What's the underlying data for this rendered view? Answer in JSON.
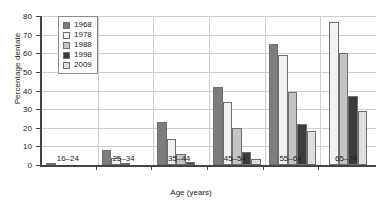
{
  "chart_data": {
    "type": "bar",
    "title": "",
    "xlabel": "Age (years)",
    "ylabel": "Percentage dentate",
    "categories": [
      "16–24",
      "25–34",
      "35–44",
      "45–54",
      "55–64",
      "65–74"
    ],
    "ylim": [
      0,
      80
    ],
    "yticks": [
      0,
      10,
      20,
      30,
      40,
      50,
      60,
      70,
      80
    ],
    "grid": true,
    "legend_position": "top-left-inside",
    "series": [
      {
        "name": "1968",
        "color": "#7d7d7d",
        "values": [
          1.0,
          8.0,
          23.0,
          42.0,
          65.0,
          null
        ]
      },
      {
        "name": "1978",
        "color": "#f2f2f2",
        "values": [
          0.0,
          4.0,
          14.0,
          34.0,
          59.0,
          77.0
        ]
      },
      {
        "name": "1988",
        "color": "#c4c4c4",
        "values": [
          0.0,
          1.0,
          6.0,
          20.0,
          39.0,
          60.0
        ]
      },
      {
        "name": "1998",
        "color": "#3b3b3b",
        "values": [
          0.0,
          0.0,
          1.5,
          7.0,
          22.0,
          37.0
        ]
      },
      {
        "name": "2009",
        "color": "#dedede",
        "values": [
          0.0,
          0.0,
          0.0,
          3.0,
          18.5,
          29.0
        ]
      }
    ]
  },
  "legend": {
    "items": [
      {
        "label": "1968"
      },
      {
        "label": "1978"
      },
      {
        "label": "1988"
      },
      {
        "label": "1998"
      },
      {
        "label": "2009"
      }
    ]
  },
  "axis": {
    "y_title": "Percentage dentate",
    "x_title": "Age (years)"
  }
}
